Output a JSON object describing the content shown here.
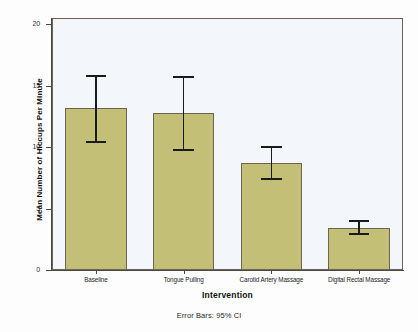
{
  "chart_data": {
    "type": "bar",
    "title": "",
    "subtitle": "",
    "xlabel": "Intervention",
    "ylabel": "Mean Number of Hiccups Per Minute",
    "categories": [
      "Baseline",
      "Tongue Pulling",
      "Carotid Artery Massage",
      "Digital Rectal Massage"
    ],
    "values": [
      13.2,
      12.8,
      8.7,
      3.4
    ],
    "error_low": [
      10.4,
      9.8,
      7.4,
      2.9
    ],
    "error_high": [
      15.8,
      15.7,
      10.0,
      4.0
    ],
    "error_type": "95% CI",
    "ylim": [
      0,
      20.5
    ],
    "yticks": [
      0,
      5,
      10,
      15,
      20
    ],
    "ytick_labels": [
      "0",
      "5",
      "10",
      "15",
      "20"
    ],
    "grid": false,
    "legend": "none",
    "footnote": "Error Bars: 95% CI",
    "bar_color": "#c3bf77",
    "bar_edge_color": "#6e6550",
    "plot_background": "#f3f6fa",
    "frame_color": "#6b6257",
    "error_bar_color": "#1a1a1a"
  }
}
